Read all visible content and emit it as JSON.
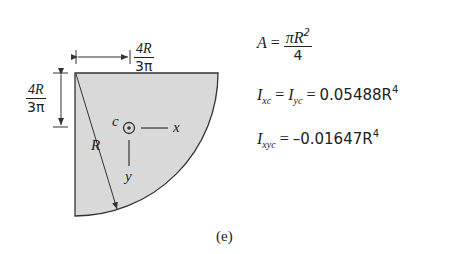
{
  "figure": {
    "caption": "(e)",
    "shape": "quarter-circle",
    "fill_color": "#d9d9d9",
    "stroke_color": "#333333",
    "labels": {
      "centroid": "c",
      "x_axis": "x",
      "y_axis": "y",
      "radius": "R",
      "horizontal_dim": {
        "numerator": "4R",
        "denominator": "3π"
      },
      "vertical_dim": {
        "numerator": "4R",
        "denominator": "3π"
      }
    }
  },
  "formulas": {
    "area": {
      "lhs": "A",
      "eq": "=",
      "numerator": "πR",
      "numerator_exp": "2",
      "denominator": "4"
    },
    "inertia": {
      "lhs1": "I",
      "sub1": "xc",
      "eq1": "=",
      "lhs2": "I",
      "sub2": "yc",
      "eq2": "=",
      "value": "0.05488R",
      "exp": "4"
    },
    "product": {
      "lhs": "I",
      "sub": "xyc",
      "eq": "=",
      "value": "–0.01647R",
      "exp": "4"
    }
  }
}
